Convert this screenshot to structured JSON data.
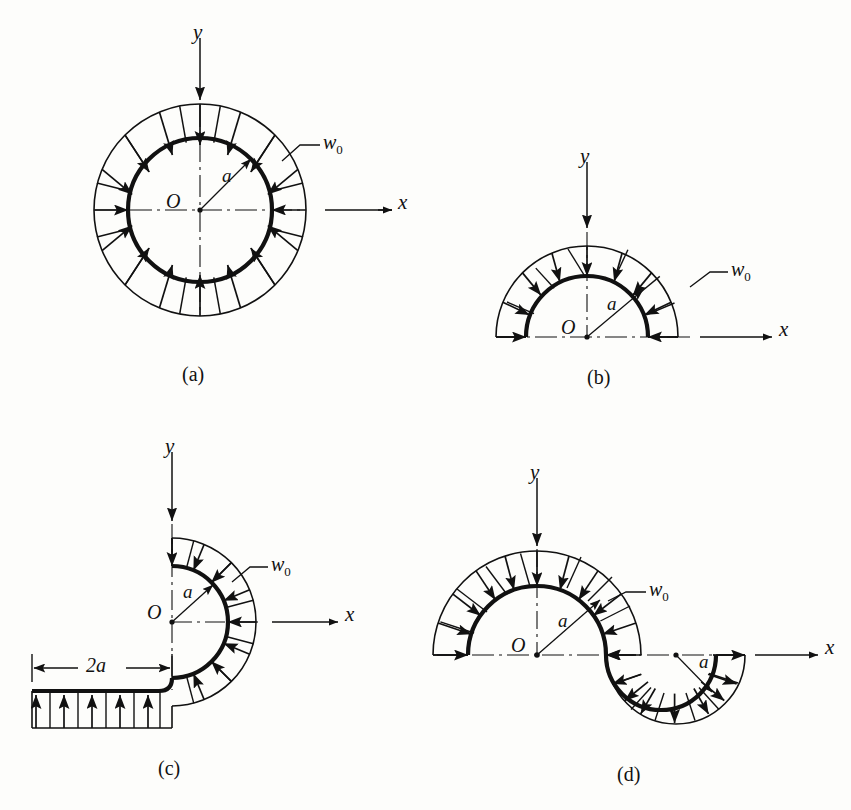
{
  "page": {
    "background_color": "#fdfdfb",
    "ink_color": "#111111"
  },
  "figures": [
    {
      "id": "a",
      "caption": "(a)",
      "shape": "full-circle",
      "origin_label": "O",
      "radius_label": "a",
      "load_label": "w",
      "load_label_sub": "0",
      "axis_x_label": "x",
      "axis_y_label": "y",
      "center": {
        "x": 200,
        "y": 210
      },
      "inner_radius": 72,
      "outer_radius": 106,
      "arrow_count": 16,
      "arrow_direction": "inward",
      "arc_start_deg": 0,
      "arc_sweep_deg": 360
    },
    {
      "id": "b",
      "caption": "(b)",
      "shape": "upper-semicircle",
      "origin_label": "O",
      "radius_label": "a",
      "load_label": "w",
      "load_label_sub": "0",
      "axis_x_label": "x",
      "axis_y_label": "y",
      "center": {
        "x": 587,
        "y": 337
      },
      "inner_radius": 61,
      "outer_radius": 91,
      "arrow_count": 9,
      "arrow_direction": "inward",
      "arc_start_deg": 0,
      "arc_sweep_deg": 180
    },
    {
      "id": "c",
      "caption": "(c)",
      "shape": "c-arc-with-straight-leg",
      "origin_label": "O",
      "radius_label": "a",
      "load_label": "w",
      "load_label_sub": "0",
      "axis_x_label": "x",
      "axis_y_label": "y",
      "dimension_label": "2a",
      "dimension_from_x": 32,
      "dimension_to_x": 172,
      "dimension_y": 668,
      "center": {
        "x": 172,
        "y": 622
      },
      "inner_radius": 56,
      "outer_radius": 84,
      "arrow_count_arc": 9,
      "arrow_count_straight": 5,
      "arrow_direction": "inward",
      "straight_leg_y": 691,
      "straight_leg_x_start": 32,
      "straight_leg_x_end": 172
    },
    {
      "id": "d",
      "caption": "(d)",
      "shape": "s-curve-two-arcs",
      "origin_label": "O",
      "radius_label_1": "a",
      "radius_label_2": "a",
      "load_label": "w",
      "load_label_sub": "0",
      "axis_x_label": "x",
      "axis_y_label": "y",
      "center_1": {
        "x": 537,
        "y": 655
      },
      "inner_radius_1": 69,
      "outer_radius_1": 104,
      "center_2": {
        "x": 676,
        "y": 655
      },
      "inner_radius_2": 40,
      "outer_radius_2": 69,
      "arrow_count_arc_1": 10,
      "arrow_count_arc_2": 9,
      "arrow_direction_1": "inward",
      "arrow_direction_2": "outward"
    }
  ],
  "labels": {
    "axis_y": "y",
    "axis_x": "x",
    "origin": "O",
    "radius": "a",
    "load_w": "w",
    "load_sub": "0",
    "dimension_2a": "2a",
    "caption_a": "(a)",
    "caption_b": "(b)",
    "caption_c": "(c)",
    "caption_d": "(d)"
  }
}
